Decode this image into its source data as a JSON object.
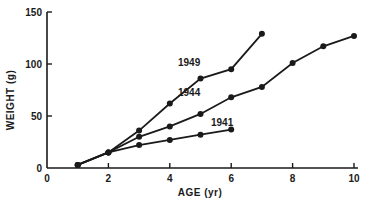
{
  "chart_data": {
    "type": "line",
    "title": "",
    "xlabel": "AGE (yr)",
    "ylabel": "WEIGHT (g)",
    "xlim": [
      0,
      10
    ],
    "ylim": [
      0,
      150
    ],
    "x_ticks": [
      "0",
      "2",
      "4",
      "6",
      "8",
      "10"
    ],
    "y_ticks": [
      "0",
      "50",
      "100",
      "150"
    ],
    "grid": false,
    "legend": "inline labels",
    "series": [
      {
        "name": "1949",
        "x": [
          1,
          2,
          3,
          4,
          5,
          6,
          7
        ],
        "values": [
          3,
          15,
          36,
          62,
          86,
          95,
          129
        ]
      },
      {
        "name": "1944",
        "x": [
          1,
          2,
          3,
          4,
          5,
          6,
          7,
          8,
          9,
          10
        ],
        "values": [
          3,
          15,
          30,
          40,
          52,
          68,
          78,
          101,
          117,
          127
        ]
      },
      {
        "name": "1941",
        "x": [
          1,
          2,
          3,
          4,
          5,
          6
        ],
        "values": [
          3,
          15,
          22,
          27,
          32,
          37
        ]
      }
    ]
  },
  "labels": {
    "xlabel": "AGE (yr)",
    "ylabel": "WEIGHT (g)",
    "series_1949": "1949",
    "series_1944": "1944",
    "series_1941": "1941"
  },
  "colors": {
    "ink": "#1a1a1a",
    "background": "#ffffff"
  }
}
